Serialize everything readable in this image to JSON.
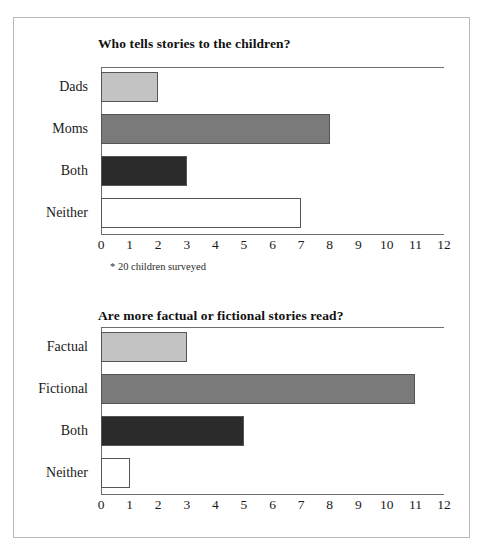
{
  "chart_data": [
    {
      "type": "bar",
      "orientation": "horizontal",
      "title": "Who tells stories to the children?",
      "categories": [
        "Dads",
        "Moms",
        "Both",
        "Neither"
      ],
      "values": [
        2,
        8,
        3,
        7
      ],
      "colors": [
        "#c3c3c3",
        "#7a7a7a",
        "#2b2b2b",
        "#ffffff"
      ],
      "xlabel": "",
      "ylabel": "",
      "xlim": [
        0,
        12
      ],
      "xticks": [
        0,
        1,
        2,
        3,
        4,
        5,
        6,
        7,
        8,
        9,
        10,
        11,
        12
      ],
      "grid": false,
      "legend": "none",
      "footnote": "* 20 children surveyed"
    },
    {
      "type": "bar",
      "orientation": "horizontal",
      "title": "Are more factual or fictional stories read?",
      "categories": [
        "Factual",
        "Fictional",
        "Both",
        "Neither"
      ],
      "values": [
        3,
        11,
        5,
        1
      ],
      "colors": [
        "#c3c3c3",
        "#7a7a7a",
        "#2b2b2b",
        "#ffffff"
      ],
      "xlabel": "",
      "ylabel": "",
      "xlim": [
        0,
        12
      ],
      "xticks": [
        0,
        1,
        2,
        3,
        4,
        5,
        6,
        7,
        8,
        9,
        10,
        11,
        12
      ],
      "grid": false,
      "legend": "none",
      "footnote": ""
    }
  ],
  "charts": {
    "top": {
      "title": "Who tells stories to the children?",
      "footnote": "* 20 children surveyed",
      "bars": [
        {
          "label": "Dads",
          "value": 2,
          "color": "#c3c3c3"
        },
        {
          "label": "Moms",
          "value": 8,
          "color": "#7a7a7a"
        },
        {
          "label": "Both",
          "value": 3,
          "color": "#2b2b2b"
        },
        {
          "label": "Neither",
          "value": 7,
          "color": "#ffffff"
        }
      ],
      "ticks": [
        "0",
        "1",
        "2",
        "3",
        "4",
        "5",
        "6",
        "7",
        "8",
        "9",
        "10",
        "11",
        "12"
      ]
    },
    "bottom": {
      "title": "Are more factual or fictional stories read?",
      "footnote": "",
      "bars": [
        {
          "label": "Factual",
          "value": 3,
          "color": "#c3c3c3"
        },
        {
          "label": "Fictional",
          "value": 11,
          "color": "#7a7a7a"
        },
        {
          "label": "Both",
          "value": 5,
          "color": "#2b2b2b"
        },
        {
          "label": "Neither",
          "value": 1,
          "color": "#ffffff"
        }
      ],
      "ticks": [
        "0",
        "1",
        "2",
        "3",
        "4",
        "5",
        "6",
        "7",
        "8",
        "9",
        "10",
        "11",
        "12"
      ]
    }
  },
  "style": {
    "axis_color": "#6d6d6d",
    "bar_stroke": "#555555",
    "frame_color": "#b9b9bd",
    "text_color": "#1a1a1a",
    "background": "#ffffff"
  }
}
